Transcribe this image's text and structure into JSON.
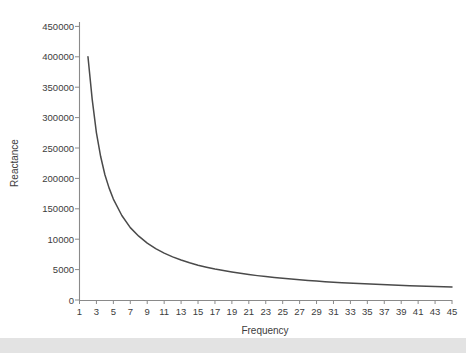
{
  "chart_data": {
    "type": "line",
    "title": "",
    "xlabel": "Frequency",
    "ylabel": "Reactance",
    "grid": false,
    "legend": false,
    "xlim": [
      1,
      45
    ],
    "ylim": [
      0,
      450000
    ],
    "x_tick_labels": [
      "1",
      "3",
      "5",
      "7",
      "9",
      "11",
      "13",
      "15",
      "17",
      "19",
      "21",
      "23",
      "25",
      "27",
      "29",
      "31",
      "33",
      "35",
      "37",
      "39",
      "41",
      "43",
      "45"
    ],
    "y_tick_labels": [
      "0",
      "5000",
      "10000",
      "150000",
      "200000",
      "250000",
      "300000",
      "350000",
      "400000",
      "450000"
    ],
    "y_tick_values": [
      0,
      50000,
      100000,
      150000,
      200000,
      250000,
      300000,
      350000,
      400000,
      450000
    ],
    "series": [
      {
        "name": "Reactance",
        "color": "#4a4a4a",
        "x": [
          2,
          2.5,
          3,
          3.5,
          4,
          4.5,
          5,
          6,
          7,
          8,
          9,
          10,
          11,
          12,
          13,
          14,
          15,
          16,
          17,
          18,
          19,
          20,
          21,
          22,
          23,
          24,
          25,
          26,
          27,
          28,
          29,
          30,
          32,
          34,
          36,
          38,
          40,
          42,
          45
        ],
        "y": [
          400000,
          330000,
          275000,
          236000,
          206000,
          184000,
          166000,
          139000,
          119000,
          105000,
          93500,
          84500,
          77000,
          71000,
          65800,
          61200,
          57300,
          54000,
          51000,
          48400,
          46000,
          43900,
          41900,
          40100,
          38500,
          37000,
          35700,
          34400,
          33200,
          32100,
          31100,
          30200,
          28500,
          27000,
          25700,
          24600,
          23600,
          22700,
          21500
        ]
      }
    ]
  },
  "figure": {
    "background_color": "#ffffff",
    "axis_color": "#8a8a8a",
    "text_color": "#3c3c3c",
    "bottom_band_color": "#e3e3e3"
  }
}
